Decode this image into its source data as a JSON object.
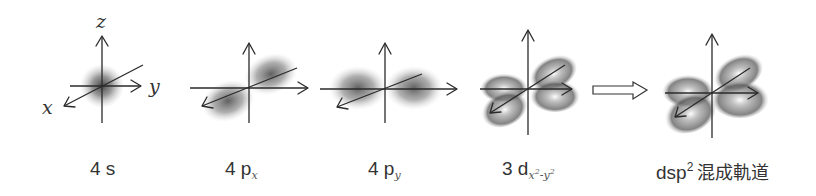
{
  "figure": {
    "type": "orbital-hybridization-diagram",
    "axis_labels": {
      "x": "x",
      "y": "y",
      "z": "z"
    },
    "panels": [
      {
        "id": "4s",
        "label_main": "4 s",
        "label_sub": "",
        "shape": "sphere"
      },
      {
        "id": "4px",
        "label_main": "4 p",
        "label_sub": "x",
        "shape": "p-lobes-along-x"
      },
      {
        "id": "4py",
        "label_main": "4 p",
        "label_sub": "y",
        "shape": "p-lobes-along-y"
      },
      {
        "id": "3dx2y2",
        "label_main": "3 d",
        "label_sub_x": "x",
        "label_sub_exp1": "2",
        "label_sub_minus": "-",
        "label_sub_y": "y",
        "label_sub_exp2": "2",
        "shape": "d-four-lobes-in-plane"
      },
      {
        "id": "dsp2",
        "label_main": "dsp",
        "label_sup": "2",
        "label_jp": "混成軌道",
        "shape": "four-hybrid-lobes-in-plane"
      }
    ],
    "transition_arrow": {
      "style": "hollow",
      "direction": "right",
      "from_panel": "3dx2y2",
      "to_panel": "dsp2"
    },
    "colors": {
      "axis": "#2a2a2a",
      "lobe_shade": "#555555",
      "text": "#333333",
      "background": "#ffffff"
    }
  }
}
